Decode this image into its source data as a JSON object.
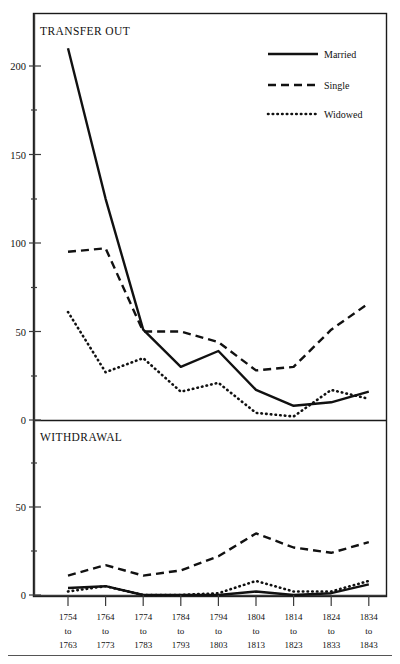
{
  "figure": {
    "background": "#ffffff",
    "ink_color": "#111111"
  },
  "legend": {
    "position": "top-right",
    "entries": [
      {
        "label": "Married",
        "style": "solid"
      },
      {
        "label": "Single",
        "style": "dashed"
      },
      {
        "label": "Widowed",
        "style": "dotted"
      }
    ]
  },
  "panels": [
    {
      "id": "transfer-out",
      "title": "TRANSFER OUT"
    },
    {
      "id": "withdrawal",
      "title": "WITHDRAWAL"
    }
  ],
  "axis": {
    "top_yticks": [
      "0",
      "50",
      "100",
      "150",
      "200"
    ],
    "bottom_yticks": [
      "0",
      "50"
    ],
    "xticklabels": [
      [
        "1754",
        "to",
        "1763"
      ],
      [
        "1764",
        "to",
        "1773"
      ],
      [
        "1774",
        "to",
        "1783"
      ],
      [
        "1784",
        "to",
        "1793"
      ],
      [
        "1794",
        "to",
        "1803"
      ],
      [
        "1804",
        "to",
        "1813"
      ],
      [
        "1814",
        "to",
        "1823"
      ],
      [
        "1824",
        "to",
        "1833"
      ],
      [
        "1834",
        "to",
        "1843"
      ]
    ]
  },
  "chart_data": [
    {
      "type": "line",
      "title": "TRANSFER OUT",
      "xlabel": "",
      "ylabel": "",
      "ylim": [
        0,
        215
      ],
      "yticks": [
        0,
        50,
        100,
        150,
        200
      ],
      "grid": false,
      "legend_position": "top right",
      "categories": [
        "1754 to 1763",
        "1764 to 1773",
        "1774 to 1783",
        "1784 to 1793",
        "1794 to 1803",
        "1804 to 1813",
        "1814 to 1823",
        "1824 to 1833",
        "1834 to 1843"
      ],
      "series": [
        {
          "name": "Married",
          "style": "solid",
          "values": [
            210,
            125,
            51,
            30,
            39,
            17,
            8,
            10,
            16
          ]
        },
        {
          "name": "Single",
          "style": "dashed",
          "values": [
            95,
            97,
            50,
            50,
            44,
            28,
            30,
            51,
            66
          ]
        },
        {
          "name": "Widowed",
          "style": "dotted",
          "values": [
            61,
            27,
            35,
            16,
            21,
            4,
            2,
            17,
            12
          ]
        }
      ]
    },
    {
      "type": "line",
      "title": "WITHDRAWAL",
      "xlabel": "",
      "ylabel": "",
      "ylim": [
        0,
        75
      ],
      "yticks": [
        0,
        50
      ],
      "grid": false,
      "legend_position": "none",
      "categories": [
        "1754 to 1763",
        "1764 to 1773",
        "1774 to 1783",
        "1784 to 1793",
        "1794 to 1803",
        "1804 to 1813",
        "1814 to 1823",
        "1824 to 1833",
        "1834 to 1843"
      ],
      "series": [
        {
          "name": "Married",
          "style": "solid",
          "values": [
            4,
            5,
            0,
            0,
            0,
            2,
            0,
            1,
            6
          ]
        },
        {
          "name": "Single",
          "style": "dashed",
          "values": [
            11,
            17,
            11,
            14,
            22,
            35,
            27,
            24,
            30
          ]
        },
        {
          "name": "Widowed",
          "style": "dotted",
          "values": [
            2,
            5,
            0,
            0,
            1,
            8,
            2,
            2,
            8
          ]
        }
      ]
    }
  ]
}
